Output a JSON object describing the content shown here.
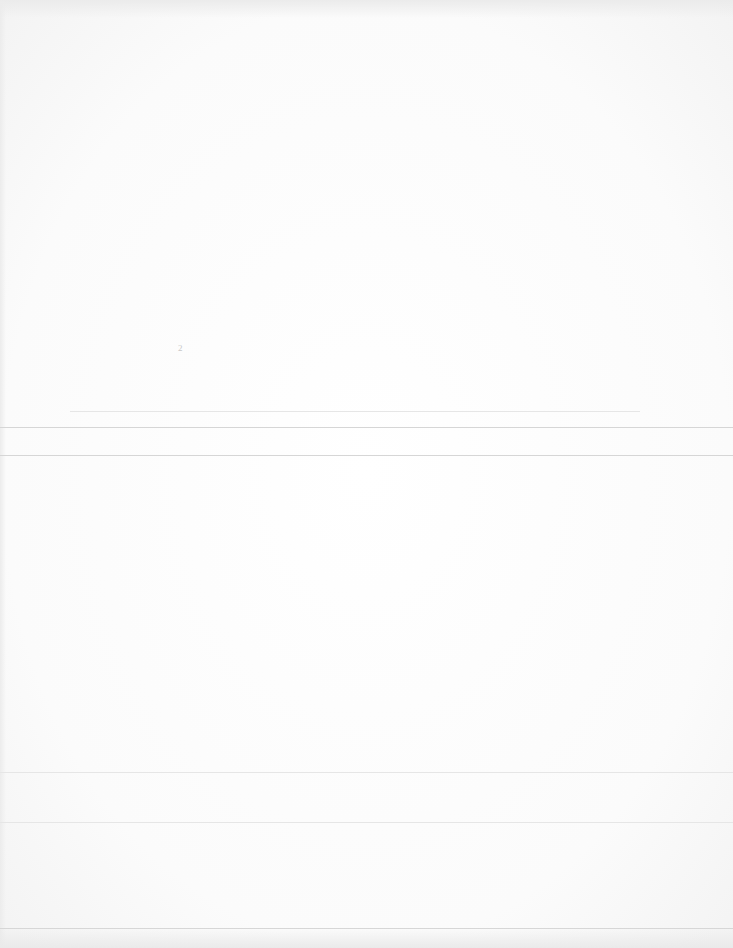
{
  "document": {
    "description": "Faded, largely illegible scanned page",
    "stray_marks": [
      "2"
    ],
    "rules": [
      {
        "y": 411,
        "x1": 70,
        "x2": 640,
        "style": "faint"
      },
      {
        "y": 427,
        "x1": 0,
        "x2": 733,
        "style": "solid"
      },
      {
        "y": 455,
        "x1": 0,
        "x2": 733,
        "style": "solid"
      },
      {
        "y": 772,
        "x1": 0,
        "x2": 733,
        "style": "faint"
      },
      {
        "y": 822,
        "x1": 0,
        "x2": 733,
        "style": "faint"
      },
      {
        "y": 928,
        "x1": 0,
        "x2": 733,
        "style": "solid"
      }
    ]
  }
}
